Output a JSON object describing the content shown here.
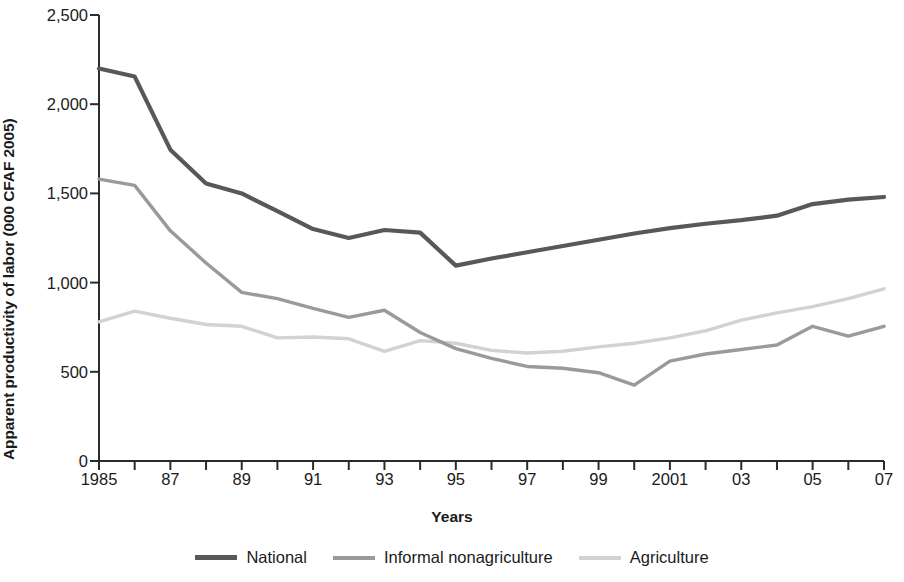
{
  "chart_data": {
    "type": "line",
    "title": "",
    "xlabel": "Years",
    "ylabel": "Apparent productivity of labor (000 CFAF 2005)",
    "xlim": [
      1985,
      2007
    ],
    "ylim": [
      0,
      2500
    ],
    "grid": false,
    "legend_position": "bottom",
    "x": [
      1985,
      1986,
      1987,
      1988,
      1989,
      1990,
      1991,
      1992,
      1993,
      1994,
      1995,
      1996,
      1997,
      1998,
      1999,
      2000,
      2001,
      2002,
      2003,
      2004,
      2005,
      2006,
      2007
    ],
    "xtick_labels": [
      "1985",
      "",
      "87",
      "",
      "89",
      "",
      "91",
      "",
      "93",
      "",
      "95",
      "",
      "97",
      "",
      "99",
      "",
      "2001",
      "",
      "03",
      "",
      "05",
      "",
      "07"
    ],
    "ytick_values": [
      0,
      500,
      1000,
      1500,
      2000,
      2500
    ],
    "ytick_labels": [
      "0",
      "500",
      "1,000",
      "1,500",
      "2,000",
      "2,500"
    ],
    "series": [
      {
        "name": "National",
        "color": "#585858",
        "width": 4.2,
        "values": [
          2200,
          2155,
          1745,
          1555,
          1500,
          1400,
          1300,
          1250,
          1295,
          1280,
          1095,
          1135,
          1170,
          1205,
          1240,
          1275,
          1305,
          1330,
          1350,
          1375,
          1440,
          1465,
          1480
        ]
      },
      {
        "name": "Informal nonagriculture",
        "color": "#9a9a9a",
        "width": 3.4,
        "values": [
          1580,
          1545,
          1290,
          1110,
          945,
          910,
          855,
          805,
          845,
          720,
          630,
          575,
          530,
          520,
          495,
          425,
          560,
          600,
          625,
          650,
          755,
          700,
          755
        ]
      },
      {
        "name": "Agriculture",
        "color": "#d2d2d2",
        "width": 3.4,
        "values": [
          780,
          840,
          800,
          765,
          755,
          690,
          695,
          685,
          615,
          675,
          660,
          620,
          605,
          615,
          640,
          660,
          690,
          730,
          790,
          830,
          865,
          910,
          965
        ]
      }
    ]
  },
  "legend": {
    "items": [
      {
        "label": "National"
      },
      {
        "label": "Informal nonagriculture"
      },
      {
        "label": "Agriculture"
      }
    ]
  },
  "axes": {
    "axis_color": "#2b2b2b"
  }
}
